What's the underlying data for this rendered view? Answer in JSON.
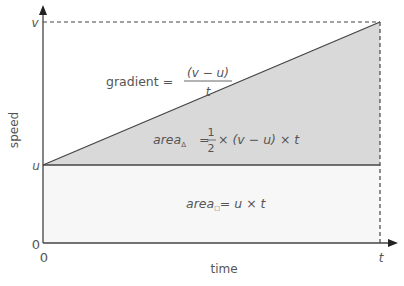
{
  "diagram": {
    "type": "speed-time graph",
    "axes": {
      "y_label": "speed",
      "x_label": "time",
      "origin_y_tick": "0",
      "origin_x_tick": "0",
      "y_ticks": [
        "u",
        "v"
      ],
      "x_ticks": [
        "t"
      ]
    },
    "formulas": {
      "gradient_lhs": "gradient =",
      "gradient_num": "(v − u)",
      "gradient_den": "t",
      "triangle_lhs": "area",
      "triangle_sub": "Δ",
      "triangle_eq": "=",
      "triangle_half_num": "1",
      "triangle_half_den": "2",
      "triangle_rhs": "× (v − u) × t",
      "rect_lhs": "area",
      "rect_sub": "□",
      "rect_rhs": "= u × t"
    },
    "colors": {
      "triangle_fill": "#d9d9d9",
      "rect_fill": "#f7f7f7",
      "line": "#444444",
      "text": "#555555"
    }
  }
}
